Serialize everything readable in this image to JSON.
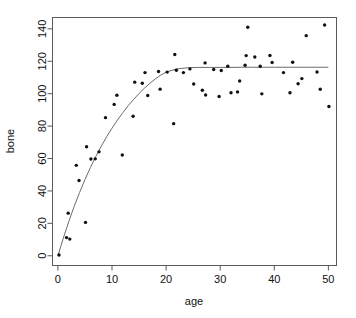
{
  "chart_data": {
    "type": "scatter",
    "title": "",
    "xlabel": "age",
    "ylabel": "bone",
    "xlim": [
      -1.0,
      51.5
    ],
    "ylim": [
      -6.0,
      147.0
    ],
    "grid": false,
    "legend": null,
    "xticks": [
      0,
      10,
      20,
      30,
      40,
      50
    ],
    "yticks": [
      0,
      20,
      40,
      60,
      80,
      100,
      120,
      140
    ],
    "xtick_labels": [
      "0",
      "10",
      "20",
      "30",
      "40",
      "50"
    ],
    "ytick_labels": [
      "0",
      "20",
      "40",
      "60",
      "80",
      "100",
      "120",
      "140"
    ],
    "points": [
      {
        "x": 0.2,
        "y": 0.5
      },
      {
        "x": 1.6,
        "y": 11.2
      },
      {
        "x": 1.9,
        "y": 26.3
      },
      {
        "x": 2.2,
        "y": 10.3
      },
      {
        "x": 3.4,
        "y": 55.8
      },
      {
        "x": 3.9,
        "y": 46.4
      },
      {
        "x": 5.1,
        "y": 20.6
      },
      {
        "x": 5.3,
        "y": 67.3
      },
      {
        "x": 6.1,
        "y": 59.7
      },
      {
        "x": 6.9,
        "y": 59.8
      },
      {
        "x": 7.6,
        "y": 64.1
      },
      {
        "x": 8.8,
        "y": 85.2
      },
      {
        "x": 10.4,
        "y": 93.4
      },
      {
        "x": 10.9,
        "y": 99.0
      },
      {
        "x": 11.9,
        "y": 62.2
      },
      {
        "x": 13.9,
        "y": 86.1
      },
      {
        "x": 14.2,
        "y": 107.1
      },
      {
        "x": 15.6,
        "y": 106.4
      },
      {
        "x": 16.1,
        "y": 113.0
      },
      {
        "x": 16.6,
        "y": 98.9
      },
      {
        "x": 18.6,
        "y": 113.7
      },
      {
        "x": 18.9,
        "y": 102.8
      },
      {
        "x": 20.2,
        "y": 113.3
      },
      {
        "x": 21.4,
        "y": 81.5
      },
      {
        "x": 21.6,
        "y": 124.2
      },
      {
        "x": 21.9,
        "y": 114.5
      },
      {
        "x": 23.2,
        "y": 113.0
      },
      {
        "x": 24.4,
        "y": 115.3
      },
      {
        "x": 25.1,
        "y": 106.0
      },
      {
        "x": 26.7,
        "y": 102.1
      },
      {
        "x": 27.2,
        "y": 119.0
      },
      {
        "x": 27.3,
        "y": 99.2
      },
      {
        "x": 28.8,
        "y": 114.9
      },
      {
        "x": 29.8,
        "y": 98.3
      },
      {
        "x": 30.2,
        "y": 114.3
      },
      {
        "x": 31.4,
        "y": 117.0
      },
      {
        "x": 32.0,
        "y": 100.6
      },
      {
        "x": 33.2,
        "y": 101.1
      },
      {
        "x": 33.6,
        "y": 107.8
      },
      {
        "x": 34.6,
        "y": 117.5
      },
      {
        "x": 34.8,
        "y": 123.5
      },
      {
        "x": 35.1,
        "y": 141.0
      },
      {
        "x": 36.4,
        "y": 122.6
      },
      {
        "x": 37.4,
        "y": 116.9
      },
      {
        "x": 37.7,
        "y": 99.9
      },
      {
        "x": 39.2,
        "y": 123.6
      },
      {
        "x": 39.6,
        "y": 119.2
      },
      {
        "x": 41.7,
        "y": 113.0
      },
      {
        "x": 42.9,
        "y": 100.6
      },
      {
        "x": 43.4,
        "y": 119.4
      },
      {
        "x": 44.4,
        "y": 106.1
      },
      {
        "x": 45.1,
        "y": 109.3
      },
      {
        "x": 45.9,
        "y": 135.8
      },
      {
        "x": 47.9,
        "y": 113.4
      },
      {
        "x": 48.5,
        "y": 102.7
      },
      {
        "x": 49.3,
        "y": 142.4
      },
      {
        "x": 50.1,
        "y": 92.1
      }
    ],
    "fit_curve": {
      "label": "fitted asymptotic growth curve",
      "x": [
        0.0,
        1.0,
        2.0,
        3.0,
        4.0,
        5.0,
        6.0,
        7.0,
        8.0,
        9.0,
        10.0,
        11.0,
        12.0,
        13.0,
        14.0,
        15.0,
        16.0,
        17.0,
        18.0,
        19.0,
        20.0,
        22.0,
        24.0,
        26.0,
        28.0,
        30.0,
        32.0,
        34.0,
        36.0,
        38.0,
        40.0,
        42.0,
        44.0,
        46.0,
        48.0,
        50.0
      ],
      "y": [
        0.0,
        10.9,
        21.0,
        30.4,
        39.0,
        47.0,
        54.4,
        61.2,
        67.5,
        73.4,
        78.7,
        83.7,
        88.3,
        92.6,
        96.5,
        100.1,
        103.4,
        106.4,
        109.1,
        111.4,
        113.3,
        115.3,
        116.0,
        116.2,
        116.2,
        116.2,
        116.2,
        116.3,
        116.3,
        116.3,
        116.3,
        116.3,
        116.3,
        116.3,
        116.3,
        116.3
      ]
    }
  },
  "colors": {
    "point": "#101010",
    "curve": "#6b6b6b",
    "frame": "#5a5a5a",
    "background": "#ffffff",
    "text": "#111111"
  }
}
